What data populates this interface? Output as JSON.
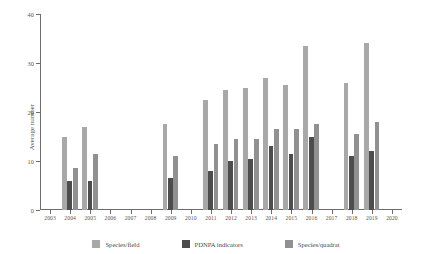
{
  "chart_data": {
    "type": "bar",
    "title": "",
    "xlabel": "",
    "ylabel": "Average number",
    "ylim": [
      0,
      40
    ],
    "yticks": [
      0,
      10,
      20,
      30,
      40
    ],
    "grid": false,
    "legend_position": "bottom",
    "categories": [
      "2003",
      "2004",
      "2005",
      "2006",
      "2007",
      "2008",
      "2009",
      "2010",
      "2011",
      "2012",
      "2013",
      "2014",
      "2015",
      "2016",
      "2017",
      "2018",
      "2019",
      "2020"
    ],
    "series": [
      {
        "name": "Species/field",
        "color": "#a8a8a8",
        "values": [
          null,
          15,
          17,
          null,
          null,
          null,
          17.5,
          null,
          22.5,
          24.5,
          25,
          27,
          25.5,
          33.5,
          null,
          26,
          34,
          null
        ]
      },
      {
        "name": "PDNPA indicators",
        "color": "#4d4d4d",
        "values": [
          null,
          6,
          6,
          null,
          null,
          null,
          6.5,
          null,
          8,
          10,
          10.5,
          13,
          11.5,
          15,
          null,
          11,
          12,
          null
        ]
      },
      {
        "name": "Species/quadrat",
        "color": "#919191",
        "values": [
          null,
          8.5,
          11.5,
          null,
          null,
          null,
          11,
          null,
          13.5,
          14.5,
          14.5,
          16.5,
          16.5,
          17.5,
          null,
          15.5,
          18,
          null
        ]
      }
    ]
  },
  "legend": {
    "items": [
      {
        "label": "Species/field",
        "color": "#a8a8a8"
      },
      {
        "label": "PDNPA indicators",
        "color": "#4d4d4d"
      },
      {
        "label": "Species/quadrat",
        "color": "#919191"
      }
    ]
  }
}
